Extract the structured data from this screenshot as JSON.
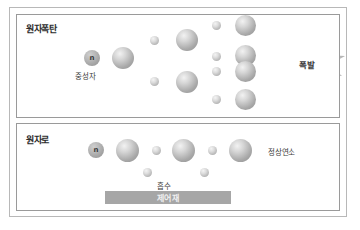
{
  "figure": {
    "kind": "nuclear-chain-reaction-diagram",
    "language": "ko"
  },
  "panels": {
    "bomb": {
      "title": "원자폭탄",
      "start_neutron_glyph": "n",
      "neutron_label": "중성자",
      "explosion_label": "폭발",
      "stage_counts": {
        "gen0_nucleus": 1,
        "gen1_neutrons": 2,
        "gen1_nuclei": 2,
        "gen2_neutrons": 4,
        "gen2_nuclei": 4
      }
    },
    "reactor": {
      "title": "원자로",
      "start_neutron_glyph": "n",
      "absorb_label": "흡수",
      "control_rod_label": "제어재",
      "steady_label": "정상연소",
      "stage_counts": {
        "nuclei": 3,
        "chain_neutrons": 2,
        "absorbed_neutrons": 2
      }
    }
  },
  "colors": {
    "frame": "#b8b8b8",
    "panel_border": "#9a9a9a",
    "control_bar": "#a6a6a6",
    "control_bar_text": "#f0f0f0",
    "text": "#3a3a3a",
    "arrow": "#444444",
    "background": "#ffffff"
  }
}
